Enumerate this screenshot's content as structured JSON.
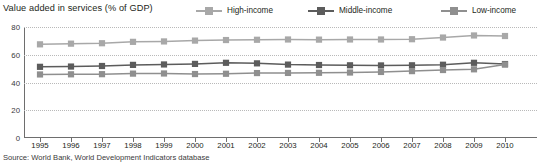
{
  "chart_data": {
    "type": "line",
    "title": "Value added in services (% of GDP)",
    "xlabel": "",
    "ylabel": "",
    "ylim": [
      0,
      80
    ],
    "yticks": [
      0,
      20,
      40,
      60,
      80
    ],
    "grid": true,
    "legend_position": "top-right",
    "x": [
      1995,
      1996,
      1997,
      1998,
      1999,
      2000,
      2001,
      2002,
      2003,
      2004,
      2005,
      2006,
      2007,
      2008,
      2009,
      2010
    ],
    "categories": [
      "1995",
      "1996",
      "1997",
      "1998",
      "1999",
      "2000",
      "2001",
      "2002",
      "2003",
      "2004",
      "2005",
      "2006",
      "2007",
      "2008",
      "2009",
      "2010"
    ],
    "series": [
      {
        "name": "High-income",
        "color": "#a8a8a8",
        "values": [
          67.5,
          68.0,
          68.3,
          69.3,
          69.6,
          70.2,
          70.6,
          70.8,
          71.0,
          70.9,
          71.0,
          71.0,
          71.2,
          72.4,
          73.9,
          73.5
        ]
      },
      {
        "name": "Middle-income",
        "color": "#5c5c5c",
        "values": [
          51.3,
          51.5,
          51.9,
          52.7,
          53.0,
          53.4,
          54.2,
          53.8,
          52.9,
          52.6,
          52.4,
          52.3,
          52.4,
          52.8,
          54.2,
          53.3
        ]
      },
      {
        "name": "Low-income",
        "color": "#8f8f8f",
        "values": [
          45.8,
          45.9,
          46.0,
          46.4,
          46.5,
          46.1,
          46.3,
          46.8,
          46.9,
          47.0,
          47.2,
          47.6,
          48.2,
          49.0,
          49.5,
          52.9
        ]
      }
    ]
  },
  "source": {
    "text": "Source: World Bank, World Development Indicators database"
  },
  "colors": {
    "high_income": "#a8a8a8",
    "middle_income": "#5c5c5c",
    "low_income": "#8f8f8f",
    "axis": "#6e6e6e",
    "grid": "#b9b9b9",
    "text": "#231f20"
  }
}
